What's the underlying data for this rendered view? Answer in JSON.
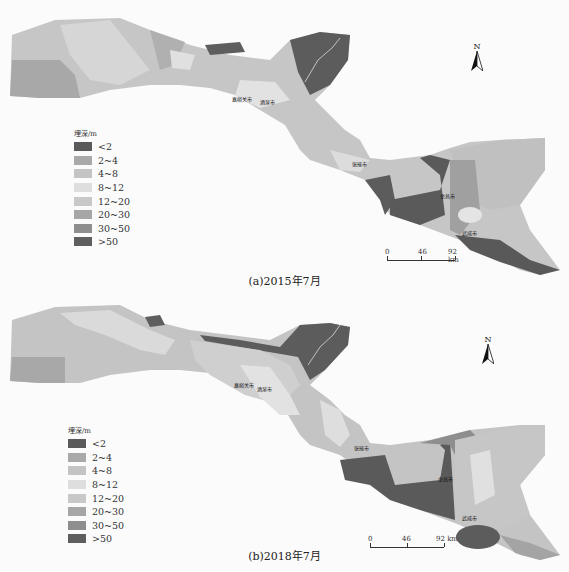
{
  "legend": {
    "title": "埋深/m",
    "classes": [
      {
        "label": "<2",
        "color": "#5a5a5a"
      },
      {
        "label": "2~4",
        "color": "#a9a9a9"
      },
      {
        "label": "4~8",
        "color": "#c4c4c4"
      },
      {
        "label": "8~12",
        "color": "#dedede"
      },
      {
        "label": "12~20",
        "color": "#c8c8c8"
      },
      {
        "label": "20~30",
        "color": "#a6a6a6"
      },
      {
        "label": "30~50",
        "color": "#8e8e8e"
      },
      {
        "label": ">50",
        "color": "#5e5e5e"
      }
    ]
  },
  "scale": {
    "ticks": [
      "0",
      "46",
      "92 km"
    ]
  },
  "north_label": "N",
  "cities": [
    "嘉峪关市",
    "酒泉市",
    "张掖市",
    "金昌市",
    "武威市"
  ],
  "panels": [
    {
      "caption": "(a)2015年7月"
    },
    {
      "caption": "(b)2018年7月"
    }
  ]
}
